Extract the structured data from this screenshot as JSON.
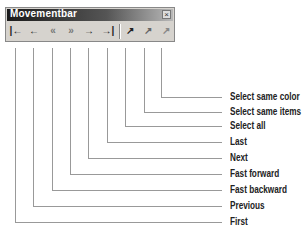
{
  "toolbar": {
    "title": "Movementbar",
    "close_glyph": "×",
    "buttons": [
      {
        "name": "first",
        "glyph": "|←"
      },
      {
        "name": "previous",
        "glyph": "←"
      },
      {
        "name": "fast-backward",
        "glyph": "«"
      },
      {
        "name": "fast-forward",
        "glyph": "»"
      },
      {
        "name": "next",
        "glyph": "→"
      },
      {
        "name": "last",
        "glyph": "→|"
      },
      {
        "name": "select-all",
        "glyph": "↗"
      },
      {
        "name": "select-same-items",
        "glyph": "↗"
      },
      {
        "name": "select-same-color",
        "glyph": "↗"
      }
    ]
  },
  "callouts": [
    {
      "label": "Select same color"
    },
    {
      "label": "Select same items"
    },
    {
      "label": "Select all"
    },
    {
      "label": "Last"
    },
    {
      "label": "Next"
    },
    {
      "label": "Fast forward"
    },
    {
      "label": "Fast backward"
    },
    {
      "label": "Previous"
    },
    {
      "label": "First"
    }
  ]
}
